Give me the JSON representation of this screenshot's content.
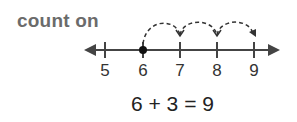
{
  "title": "count on",
  "number_line": {
    "ticks": [
      {
        "value": "5",
        "x": 105
      },
      {
        "value": "6",
        "x": 143
      },
      {
        "value": "7",
        "x": 180
      },
      {
        "value": "8",
        "x": 217
      },
      {
        "value": "9",
        "x": 254
      }
    ],
    "start_point": "6",
    "hops": 3,
    "line_color": "#444444"
  },
  "equation": "6 + 3 = 9"
}
